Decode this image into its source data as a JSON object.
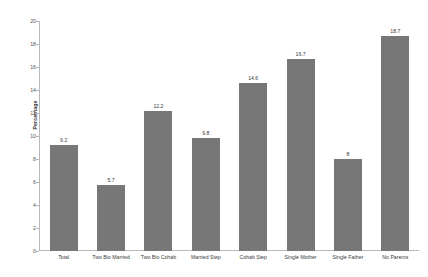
{
  "chart_data": {
    "type": "bar",
    "title": "",
    "subtitle": "",
    "xlabel": "",
    "ylabel": "Percentage",
    "ylim": [
      0,
      20
    ],
    "ytick_interval": 2,
    "yticks": [
      "0",
      "2",
      "4",
      "6",
      "8",
      "10",
      "12",
      "14",
      "16",
      "18",
      "20"
    ],
    "grid": false,
    "legend": false,
    "bar_color": "#777777",
    "background_color": "#ffffff",
    "categories": [
      "Total",
      "Two Bio Married",
      "Two Bio Cohab",
      "Married Step",
      "Cohab Step",
      "Single Mother",
      "Single Father",
      "No Parents"
    ],
    "values": [
      9.2,
      5.7,
      12.2,
      9.8,
      14.6,
      16.7,
      8,
      18.7
    ],
    "value_labels": [
      "9.2",
      "5.7",
      "12.2",
      "9.8",
      "14.6",
      "16.7",
      "8",
      "18.7"
    ]
  },
  "watermark": {
    "text": ""
  }
}
